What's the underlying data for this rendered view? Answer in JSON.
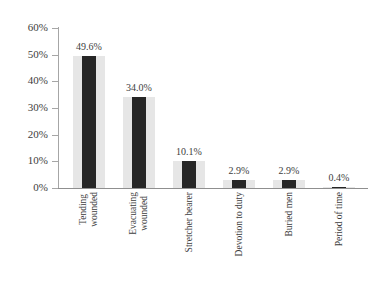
{
  "chart_data": {
    "type": "bar",
    "title": "",
    "subtitle": "",
    "xlabel": "",
    "ylabel": "",
    "categories": [
      "Tending wounded",
      "Evacuating wounded",
      "Stretcher bearer",
      "Devotion to duty",
      "Buried men",
      "Period of time"
    ],
    "category_lines": [
      [
        "Tending",
        "wounded"
      ],
      [
        "Evacuating",
        "wounded"
      ],
      [
        "Stretcher bearer"
      ],
      [
        "Devotion to duty"
      ],
      [
        "Buried men"
      ],
      [
        "Period of time"
      ]
    ],
    "values": [
      49.6,
      34.0,
      10.1,
      2.9,
      2.9,
      0.4
    ],
    "data_labels": [
      "49.6%",
      "34.0%",
      "10.1%",
      "2.9%",
      "2.9%",
      "0.4%"
    ],
    "ylim": [
      0,
      60
    ],
    "y_ticks": [
      0,
      10,
      20,
      30,
      40,
      50,
      60
    ],
    "y_tick_labels": [
      "0%",
      "10%",
      "20%",
      "30%",
      "40%",
      "50%",
      "60%"
    ],
    "grid": false,
    "legend": null,
    "legend_position": "none",
    "colors": {
      "bar_fill": "#262626",
      "bar_band": "#e6e6e6",
      "axis": "#a6a6a6",
      "text": "#3d3d3d",
      "background": "#ffffff"
    }
  },
  "axes": {
    "y_tick_labels": [
      "60%",
      "50%",
      "40%",
      "30%",
      "20%",
      "10%",
      "0%"
    ]
  },
  "bars": [
    {
      "label": "49.6%",
      "value": 49.6,
      "cat_l1": "Tending",
      "cat_l2": "wounded"
    },
    {
      "label": "34.0%",
      "value": 34.0,
      "cat_l1": "Evacuating",
      "cat_l2": "wounded"
    },
    {
      "label": "10.1%",
      "value": 10.1,
      "cat_l1": "Stretcher bearer",
      "cat_l2": ""
    },
    {
      "label": "2.9%",
      "value": 2.9,
      "cat_l1": "Devotion to duty",
      "cat_l2": ""
    },
    {
      "label": "2.9%",
      "value": 2.9,
      "cat_l1": "Buried men",
      "cat_l2": ""
    },
    {
      "label": "0.4%",
      "value": 0.4,
      "cat_l1": "Period of time",
      "cat_l2": ""
    }
  ]
}
